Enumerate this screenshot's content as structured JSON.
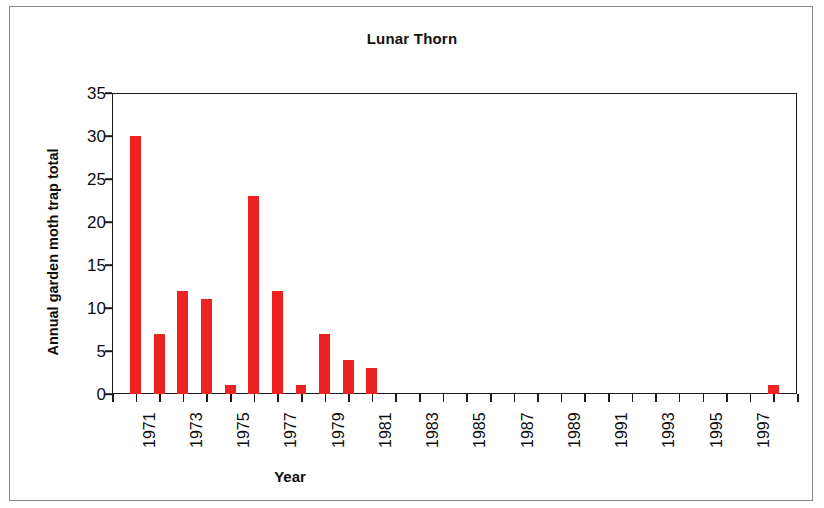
{
  "figure": {
    "title": "Lunar Thorn",
    "background_color": "#ffffff",
    "border_color": "#8a8a8a",
    "axis_color": "#1a1a1a"
  },
  "chart_data": {
    "type": "bar",
    "title": "Lunar Thorn",
    "xlabel": "Year",
    "ylabel": "Annual garden moth trap total",
    "ylim": [
      0,
      35
    ],
    "ytick_step": 5,
    "yticks": [
      0,
      5,
      10,
      15,
      20,
      25,
      30,
      35
    ],
    "xlim": [
      1970.5,
      1999.5
    ],
    "grid": false,
    "legend": false,
    "bar_color": "#ee2222",
    "categories": [
      1971,
      1972,
      1973,
      1974,
      1975,
      1976,
      1977,
      1978,
      1979,
      1980,
      1981,
      1982,
      1983,
      1984,
      1985,
      1986,
      1987,
      1988,
      1989,
      1990,
      1991,
      1992,
      1993,
      1994,
      1995,
      1996,
      1997,
      1998,
      1999
    ],
    "values": [
      30,
      7,
      12,
      11,
      1,
      23,
      12,
      1,
      7,
      4,
      3,
      0,
      0,
      0,
      0,
      0,
      0,
      0,
      0,
      0,
      0,
      0,
      0,
      0,
      0,
      0,
      0,
      1,
      0
    ],
    "xtick_labels": [
      "1971",
      "1973",
      "1975",
      "1977",
      "1979",
      "1981",
      "1983",
      "1985",
      "1987",
      "1989",
      "1991",
      "1993",
      "1995",
      "1997"
    ],
    "xtick_values": [
      1971,
      1973,
      1975,
      1977,
      1979,
      1981,
      1983,
      1985,
      1987,
      1989,
      1991,
      1993,
      1995,
      1997
    ]
  }
}
